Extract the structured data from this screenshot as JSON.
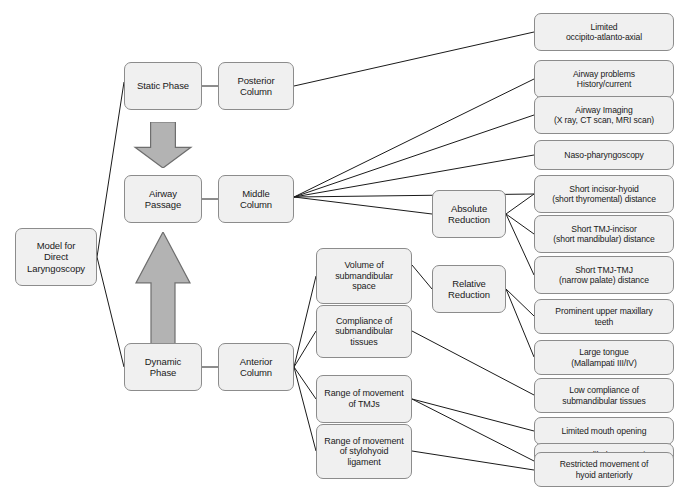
{
  "diagram": {
    "type": "flowchart",
    "colors": {
      "node_fill": "#f0f0f0",
      "node_border": "#8c8c8c",
      "arrow_fill": "#b3b3b3",
      "arrow_border": "#6e6e6e",
      "edge_line": "#1a1a1a",
      "background": "#ffffff",
      "text": "#1a1a1a"
    },
    "nodes": {
      "root": {
        "id": "root",
        "label": "Model for\nDirect\nLaryngoscopy",
        "x": 15,
        "y": 228,
        "w": 82,
        "h": 58,
        "font": 9.5
      },
      "static_phase": {
        "id": "static_phase",
        "label": "Static Phase",
        "x": 124,
        "y": 62,
        "w": 78,
        "h": 48,
        "font": 9.5
      },
      "airway_passage": {
        "id": "airway_passage",
        "label": "Airway\nPassage",
        "x": 124,
        "y": 175,
        "w": 78,
        "h": 48,
        "font": 9.5
      },
      "dynamic_phase": {
        "id": "dynamic_phase",
        "label": "Dynamic\nPhase",
        "x": 124,
        "y": 343,
        "w": 78,
        "h": 48,
        "font": 9.5
      },
      "posterior_column": {
        "id": "posterior_column",
        "label": "Posterior\nColumn",
        "x": 218,
        "y": 62,
        "w": 76,
        "h": 48,
        "font": 9.5
      },
      "middle_column": {
        "id": "middle_column",
        "label": "Middle\nColumn",
        "x": 218,
        "y": 175,
        "w": 76,
        "h": 48,
        "font": 9.5
      },
      "anterior_column": {
        "id": "anterior_column",
        "label": "Anterior\nColumn",
        "x": 218,
        "y": 343,
        "w": 76,
        "h": 48,
        "font": 9.5
      },
      "volume_submandibular": {
        "id": "volume_submandibular",
        "label": "Volume of\nsubmandibular\nspace",
        "x": 316,
        "y": 248,
        "w": 96,
        "h": 56,
        "font": 9
      },
      "compliance_submandibular": {
        "id": "compliance_submandibular",
        "label": "Compliance of\nsubmandibular\ntissues",
        "x": 316,
        "y": 305,
        "w": 96,
        "h": 53,
        "font": 9
      },
      "range_tmjs": {
        "id": "range_tmjs",
        "label": "Range of movement\nof TMJs",
        "x": 316,
        "y": 375,
        "w": 96,
        "h": 48,
        "font": 9
      },
      "range_stylohyoid": {
        "id": "range_stylohyoid",
        "label": "Range of movement\nof stylohyoid\nligament",
        "x": 316,
        "y": 424,
        "w": 96,
        "h": 55,
        "font": 9
      },
      "absolute_reduction": {
        "id": "absolute_reduction",
        "label": "Absolute\nReduction",
        "x": 432,
        "y": 190,
        "w": 74,
        "h": 48,
        "font": 9.5
      },
      "relative_reduction": {
        "id": "relative_reduction",
        "label": "Relative\nReduction",
        "x": 432,
        "y": 265,
        "w": 74,
        "h": 48,
        "font": 9.5
      },
      "r01": {
        "id": "r01",
        "label": "Limited\noccipito-atlanto-axial",
        "x": 534,
        "y": 13,
        "w": 140,
        "h": 38,
        "font": 8.6
      },
      "r02": {
        "id": "r02",
        "label": "Airway  problems\nHistory/current",
        "x": 534,
        "y": 60,
        "w": 140,
        "h": 38,
        "font": 8.6
      },
      "r03": {
        "id": "r03",
        "label": "Airway Imaging\n(X ray, CT scan, MRI scan)",
        "x": 534,
        "y": 96,
        "w": 140,
        "h": 38,
        "font": 8.6
      },
      "r04": {
        "id": "r04",
        "label": "Naso-pharyngoscopy",
        "x": 534,
        "y": 140,
        "w": 140,
        "h": 30,
        "font": 8.6
      },
      "r05": {
        "id": "r05",
        "label": "Short incisor-hyoid\n(short thyromental) distance",
        "x": 534,
        "y": 175,
        "w": 140,
        "h": 38,
        "font": 8.6
      },
      "r06": {
        "id": "r06",
        "label": "Short TMJ-incisor\n(short mandibular) distance",
        "x": 534,
        "y": 215,
        "w": 140,
        "h": 38,
        "font": 8.6
      },
      "r07": {
        "id": "r07",
        "label": "Short TMJ-TMJ\n(narrow palate) distance",
        "x": 534,
        "y": 256,
        "w": 140,
        "h": 38,
        "font": 8.6
      },
      "r08": {
        "id": "r08",
        "label": "Prominent upper maxillary\nteeth",
        "x": 534,
        "y": 299,
        "w": 140,
        "h": 35,
        "font": 8.6
      },
      "r09": {
        "id": "r09",
        "label": "Large tongue\n(Mallampati III/IV)",
        "x": 534,
        "y": 340,
        "w": 140,
        "h": 35,
        "font": 8.6
      },
      "r10": {
        "id": "r10",
        "label": "Low compliance of\nsubmandibular tissues",
        "x": 534,
        "y": 378,
        "w": 140,
        "h": 35,
        "font": 8.6
      },
      "r11": {
        "id": "r11",
        "label": "Limited mouth opening",
        "x": 534,
        "y": 417,
        "w": 140,
        "h": 28,
        "font": 8.6
      },
      "r12": {
        "id": "r12",
        "label": "Poor mandibular protrusion\nin front of maxilla",
        "x": 534,
        "y": 443,
        "w": 140,
        "h": 35,
        "font": 8.6
      },
      "r13": {
        "id": "r13",
        "label": "Restricted movement of\nhyoid anteriorly",
        "x": 534,
        "y": 452,
        "w": 140,
        "h": 35,
        "font": 8.6
      }
    },
    "arrows": [
      {
        "id": "arrow-down-static-to-airway",
        "direction": "down",
        "x": 132,
        "y": 122,
        "w": 62,
        "h": 46
      },
      {
        "id": "arrow-up-dynamic-to-airway",
        "direction": "up",
        "x": 133,
        "y": 232,
        "w": 60,
        "h": 113
      }
    ],
    "edges": [
      {
        "from": "root",
        "to": "static_phase",
        "x1": 97,
        "y1": 257,
        "x2": 124,
        "y2": 82
      },
      {
        "from": "root",
        "to": "dynamic_phase",
        "x1": 97,
        "y1": 257,
        "x2": 124,
        "y2": 367
      },
      {
        "from": "static_phase",
        "to": "posterior_column",
        "x1": 202,
        "y1": 86,
        "x2": 218,
        "y2": 86
      },
      {
        "from": "airway_passage",
        "to": "middle_column",
        "x1": 202,
        "y1": 199,
        "x2": 218,
        "y2": 199
      },
      {
        "from": "dynamic_phase",
        "to": "anterior_column",
        "x1": 202,
        "y1": 367,
        "x2": 218,
        "y2": 367
      },
      {
        "from": "posterior_column",
        "to": "r01",
        "x1": 294,
        "y1": 86,
        "x2": 534,
        "y2": 32
      },
      {
        "from": "middle_column",
        "to": "r02",
        "x1": 294,
        "y1": 197,
        "x2": 534,
        "y2": 79
      },
      {
        "from": "middle_column",
        "to": "r03",
        "x1": 294,
        "y1": 197,
        "x2": 534,
        "y2": 115
      },
      {
        "from": "middle_column",
        "to": "r04",
        "x1": 294,
        "y1": 197,
        "x2": 534,
        "y2": 155
      },
      {
        "from": "middle_column",
        "to": "r05",
        "x1": 294,
        "y1": 197,
        "x2": 534,
        "y2": 194
      },
      {
        "from": "middle_column",
        "to": "absolute_reduction",
        "x1": 294,
        "y1": 197,
        "x2": 432,
        "y2": 214
      },
      {
        "from": "absolute_reduction",
        "to": "r05b",
        "x1": 506,
        "y1": 214,
        "x2": 534,
        "y2": 194
      },
      {
        "from": "absolute_reduction",
        "to": "r06",
        "x1": 506,
        "y1": 214,
        "x2": 534,
        "y2": 234
      },
      {
        "from": "absolute_reduction",
        "to": "r07",
        "x1": 506,
        "y1": 214,
        "x2": 534,
        "y2": 275
      },
      {
        "from": "anterior_column",
        "to": "volume_submandibular",
        "x1": 294,
        "y1": 367,
        "x2": 316,
        "y2": 276
      },
      {
        "from": "anterior_column",
        "to": "compliance_submandibular",
        "x1": 294,
        "y1": 367,
        "x2": 316,
        "y2": 331
      },
      {
        "from": "anterior_column",
        "to": "range_tmjs",
        "x1": 294,
        "y1": 367,
        "x2": 316,
        "y2": 399
      },
      {
        "from": "anterior_column",
        "to": "range_stylohyoid",
        "x1": 294,
        "y1": 367,
        "x2": 316,
        "y2": 451
      },
      {
        "from": "volume_submandibular",
        "to": "relative_reduction",
        "x1": 412,
        "y1": 265,
        "x2": 432,
        "y2": 289
      },
      {
        "from": "relative_reduction",
        "to": "r08",
        "x1": 506,
        "y1": 289,
        "x2": 534,
        "y2": 316
      },
      {
        "from": "relative_reduction",
        "to": "r09",
        "x1": 506,
        "y1": 289,
        "x2": 534,
        "y2": 357
      },
      {
        "from": "compliance_submandibular",
        "to": "r10",
        "x1": 412,
        "y1": 331,
        "x2": 534,
        "y2": 395
      },
      {
        "from": "range_tmjs",
        "to": "r11",
        "x1": 412,
        "y1": 399,
        "x2": 534,
        "y2": 431
      },
      {
        "from": "range_tmjs",
        "to": "r12",
        "x1": 412,
        "y1": 399,
        "x2": 534,
        "y2": 461
      },
      {
        "from": "range_stylohyoid",
        "to": "r13",
        "x1": 412,
        "y1": 451,
        "x2": 534,
        "y2": 470
      }
    ]
  }
}
